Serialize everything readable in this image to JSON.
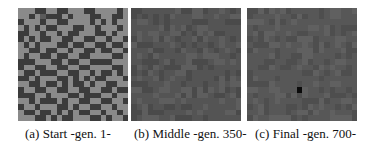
{
  "figure": {
    "panels": [
      {
        "id": "a",
        "caption": "(a) Start -gen. 1-",
        "grid_size": 20,
        "palette": [
          "#3b3b3b",
          "#5a5a5a",
          "#8a8a8a"
        ],
        "pattern": [
          "22200220022200222202",
          "22021000202220022002",
          "02220220022220202022",
          "20202002220022022202",
          "00220220200222002022",
          "02020022002200220220",
          "20202220020022002002",
          "22002002202200200220",
          "20220020022002222002",
          "00022200200220000222",
          "02200220022002222002",
          "20020002200220200202",
          "00202220020202002220",
          "22002002020020220022",
          "02200220022002200200",
          "00022022200200022022",
          "22020002022002200220",
          "02202220020220022022",
          "20020020202002202202",
          "22200202002220020220"
        ]
      },
      {
        "id": "b",
        "caption": "(b) Middle -gen. 350-",
        "grid_size": 20,
        "palette": [
          "#4a4a4a",
          "#545454",
          "#5e5e5e"
        ],
        "seed": 350
      },
      {
        "id": "c",
        "caption": "(c) Final -gen. 700-",
        "grid_size": 20,
        "palette": [
          "#4e4e4e",
          "#575757",
          "#606060"
        ],
        "seed": 700,
        "highlight": {
          "row": 14,
          "col": 9,
          "color": "#0a0a0a"
        }
      }
    ]
  }
}
